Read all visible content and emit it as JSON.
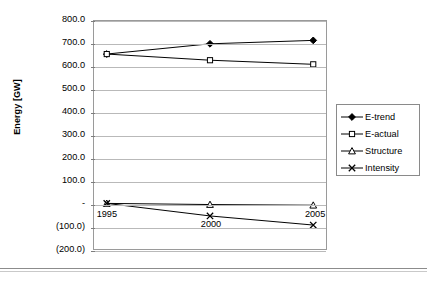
{
  "chart_data": {
    "type": "line",
    "title": "",
    "xlabel": "",
    "ylabel": "Energy [GW]",
    "x": [
      1995,
      2000,
      2005
    ],
    "categories": [
      "1995",
      "2000",
      "2005"
    ],
    "xtick_labels": [
      "1995",
      "2000",
      "2005"
    ],
    "ytick_labels": [
      "800.0",
      "700.0",
      "600.0",
      "500.0",
      "400.0",
      "300.0",
      "200.0",
      "100.0",
      "-",
      "(100.0)",
      "(200.0)"
    ],
    "ytick_values": [
      800,
      700,
      600,
      500,
      400,
      300,
      200,
      100,
      0,
      -100,
      -200
    ],
    "ylim": [
      -200,
      800
    ],
    "grid": true,
    "legend_position": "right",
    "series": [
      {
        "name": "E-trend",
        "marker": "filled-diamond",
        "values": [
          655,
          700,
          715
        ]
      },
      {
        "name": "E-actual",
        "marker": "open-square",
        "values": [
          655,
          628,
          610
        ]
      },
      {
        "name": "Structure",
        "marker": "open-triangle",
        "values": [
          0,
          -5,
          -8
        ]
      },
      {
        "name": "Intensity",
        "marker": "cross-x",
        "values": [
          0,
          -55,
          -95
        ]
      }
    ],
    "colors": {
      "line": "#000000",
      "grid": "#b9b9b9",
      "frame": "#9a9a9a",
      "background": "#ffffff"
    }
  },
  "axis": {
    "y_title": "Energy [GW]"
  },
  "legend": {
    "entries": [
      {
        "label": "E-trend"
      },
      {
        "label": "E-actual"
      },
      {
        "label": "Structure"
      },
      {
        "label": "Intensity"
      }
    ]
  }
}
